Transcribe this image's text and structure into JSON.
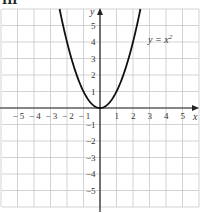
{
  "header": {
    "label": "III"
  },
  "chart_data": {
    "type": "line",
    "title": "",
    "xlabel": "x",
    "ylabel": "y",
    "xlim": [
      -6,
      6
    ],
    "ylim": [
      -6,
      6
    ],
    "grid": true,
    "x_ticks": [
      "-5",
      "-4",
      "-3",
      "-2",
      "-1",
      "1",
      "2",
      "3",
      "4",
      "5"
    ],
    "y_ticks": [
      "5",
      "4",
      "3",
      "2",
      "1",
      "-1",
      "-2",
      "-3",
      "-4",
      "-5"
    ],
    "series": [
      {
        "name": "y = x²",
        "function": "y = x^2",
        "x": [
          -2.45,
          -2,
          -1.5,
          -1,
          -0.5,
          0,
          0.5,
          1,
          1.5,
          2,
          2.45
        ],
        "y": [
          6.0,
          4,
          2.25,
          1,
          0.25,
          0,
          0.25,
          1,
          2.25,
          4,
          6.0
        ]
      }
    ],
    "annotations": [
      {
        "text": "y = x²",
        "x": 3.2,
        "y": 4
      }
    ]
  },
  "labels": {
    "equation_y": "y = x",
    "equation_sup": "2",
    "x_axis": "x",
    "y_axis": "y"
  }
}
